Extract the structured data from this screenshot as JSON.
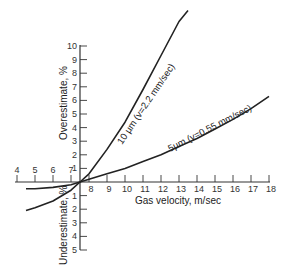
{
  "chart_data": {
    "type": "line",
    "title": "",
    "xlabel": "Gas velocity,  m/sec",
    "ylabel_top": "Overestimate, %",
    "ylabel_bottom": "Underestimate, %",
    "x_ticks": [
      4,
      5,
      6,
      7,
      8,
      9,
      10,
      11,
      12,
      13,
      14,
      15,
      16,
      17,
      18
    ],
    "x_tick_labels": [
      "4",
      "5",
      "6",
      "7",
      "8",
      "9",
      "10",
      "11",
      "12",
      "13",
      "14",
      "15",
      "16",
      "17",
      "18"
    ],
    "y_ticks_over": [
      1,
      2,
      3,
      4,
      5,
      6,
      7,
      8,
      9,
      10
    ],
    "y_tick_labels_over": [
      "1",
      "2",
      "3",
      "4",
      "5",
      "6",
      "7",
      "8",
      "9",
      "10"
    ],
    "y_ticks_under": [
      1,
      2,
      3,
      4,
      5
    ],
    "y_tick_labels_under": [
      "1",
      "2",
      "3",
      "4",
      "5"
    ],
    "xlim": [
      4,
      18
    ],
    "ylim": [
      -5,
      12
    ],
    "grid": false,
    "axis_crossing_x": 7.5,
    "series": [
      {
        "name": "10 µm (v=2.2 mm/sec)",
        "label": "10 µm (v=2.2 mm/sec)",
        "x": [
          4.5,
          5,
          6,
          7,
          7.5,
          8,
          9,
          10,
          11,
          12,
          13,
          13.5
        ],
        "y": [
          -2.1,
          -1.9,
          -1.4,
          -0.6,
          0,
          0.6,
          2.4,
          4.4,
          6.8,
          9.3,
          11.8,
          12.6
        ]
      },
      {
        "name": "5 µm (v=0.55 mm/sec)",
        "label": "5µm (v=0.55 mm/sec)",
        "x": [
          4.5,
          5,
          6,
          7,
          7.5,
          8,
          9,
          10,
          11,
          12,
          13,
          14,
          15,
          16,
          17,
          18
        ],
        "y": [
          -0.5,
          -0.5,
          -0.4,
          -0.2,
          0,
          0.2,
          0.6,
          1.0,
          1.5,
          2.0,
          2.6,
          3.2,
          3.9,
          4.6,
          5.4,
          6.3
        ]
      }
    ]
  }
}
